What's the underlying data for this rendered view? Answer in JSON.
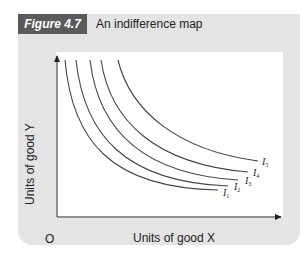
{
  "figure": {
    "tag": "Figure 4.7",
    "title": "An indifference map"
  },
  "colors": {
    "panel_bg": "#e4e4e4",
    "tag_bg": "#5a5a5a",
    "curve": "#444444"
  },
  "chart_data": {
    "type": "line",
    "title": "An indifference map",
    "xlabel": "Units of good X",
    "ylabel": "Units of good Y",
    "origin_label": "O",
    "grid": false,
    "legend": "curve labels at right ends",
    "series": [
      {
        "name": "I1",
        "label": "I",
        "sub": "1",
        "path": "M65,60 C72,140 110,188 218,190"
      },
      {
        "name": "I2",
        "label": "I",
        "sub": "2",
        "path": "M76,60 C84,134 124,182 228,186"
      },
      {
        "name": "I3",
        "label": "I",
        "sub": "3",
        "path": "M90,60 C98,128 140,174 238,180"
      },
      {
        "name": "I4",
        "label": "I",
        "sub": "4",
        "path": "M101,60 C110,120 154,164 248,172"
      },
      {
        "name": "I5",
        "label": "I",
        "sub": "5",
        "path": "M118,60 C130,110 176,150 258,161"
      }
    ],
    "label_positions": [
      {
        "x": 223,
        "y": 196
      },
      {
        "x": 234,
        "y": 190
      },
      {
        "x": 245,
        "y": 184
      },
      {
        "x": 253,
        "y": 176
      },
      {
        "x": 262,
        "y": 165
      }
    ]
  }
}
